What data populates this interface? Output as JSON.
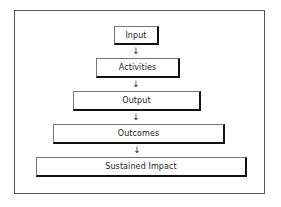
{
  "diagram": {
    "type": "vertical-flowchart",
    "nodes": [
      {
        "id": "input",
        "label": "Input"
      },
      {
        "id": "activities",
        "label": "Activities"
      },
      {
        "id": "output",
        "label": "Output"
      },
      {
        "id": "outcomes",
        "label": "Outcomes"
      },
      {
        "id": "sustained_impact",
        "label": "Sustained Impact"
      }
    ],
    "edges": [
      {
        "from": "input",
        "to": "activities"
      },
      {
        "from": "activities",
        "to": "output"
      },
      {
        "from": "output",
        "to": "outcomes"
      },
      {
        "from": "outcomes",
        "to": "sustained_impact"
      }
    ],
    "arrow_glyph": "↓",
    "colors": {
      "background": "#ffffff",
      "border": "#111111",
      "text": "#222222"
    }
  }
}
